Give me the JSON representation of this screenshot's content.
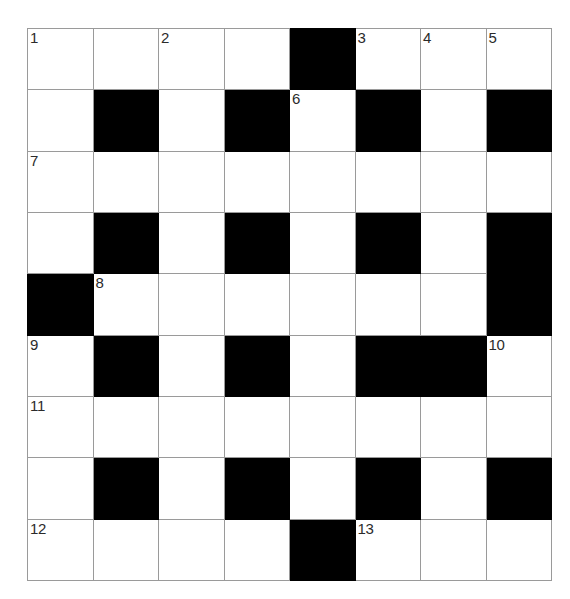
{
  "puzzle": {
    "title": "Crossword Grid",
    "rows": 9,
    "columns": 8,
    "cell_colors": {
      "open": "#ffffff",
      "blocked": "#000000",
      "grid_line": "#9a9a9a",
      "number_text": "#2b2b2b"
    },
    "grid": [
      [
        {
          "state": "open",
          "number": "1"
        },
        {
          "state": "open",
          "number": ""
        },
        {
          "state": "open",
          "number": "2"
        },
        {
          "state": "open",
          "number": ""
        },
        {
          "state": "blocked",
          "number": ""
        },
        {
          "state": "open",
          "number": "3"
        },
        {
          "state": "open",
          "number": "4"
        },
        {
          "state": "open",
          "number": "5"
        }
      ],
      [
        {
          "state": "open",
          "number": ""
        },
        {
          "state": "blocked",
          "number": ""
        },
        {
          "state": "open",
          "number": ""
        },
        {
          "state": "blocked",
          "number": ""
        },
        {
          "state": "open",
          "number": "6"
        },
        {
          "state": "blocked",
          "number": ""
        },
        {
          "state": "open",
          "number": ""
        },
        {
          "state": "blocked",
          "number": ""
        }
      ],
      [
        {
          "state": "open",
          "number": "7"
        },
        {
          "state": "open",
          "number": ""
        },
        {
          "state": "open",
          "number": ""
        },
        {
          "state": "open",
          "number": ""
        },
        {
          "state": "open",
          "number": ""
        },
        {
          "state": "open",
          "number": ""
        },
        {
          "state": "open",
          "number": ""
        },
        {
          "state": "open",
          "number": ""
        }
      ],
      [
        {
          "state": "open",
          "number": ""
        },
        {
          "state": "blocked",
          "number": ""
        },
        {
          "state": "open",
          "number": ""
        },
        {
          "state": "blocked",
          "number": ""
        },
        {
          "state": "open",
          "number": ""
        },
        {
          "state": "blocked",
          "number": ""
        },
        {
          "state": "open",
          "number": ""
        },
        {
          "state": "blocked",
          "number": ""
        }
      ],
      [
        {
          "state": "blocked",
          "number": ""
        },
        {
          "state": "open",
          "number": "8"
        },
        {
          "state": "open",
          "number": ""
        },
        {
          "state": "open",
          "number": ""
        },
        {
          "state": "open",
          "number": ""
        },
        {
          "state": "open",
          "number": ""
        },
        {
          "state": "open",
          "number": ""
        },
        {
          "state": "blocked",
          "number": ""
        }
      ],
      [
        {
          "state": "open",
          "number": "9"
        },
        {
          "state": "blocked",
          "number": ""
        },
        {
          "state": "open",
          "number": ""
        },
        {
          "state": "blocked",
          "number": ""
        },
        {
          "state": "open",
          "number": ""
        },
        {
          "state": "blocked",
          "number": ""
        },
        {
          "state": "blocked",
          "number": ""
        },
        {
          "state": "open",
          "number": "10"
        }
      ],
      [
        {
          "state": "open",
          "number": "11"
        },
        {
          "state": "open",
          "number": ""
        },
        {
          "state": "open",
          "number": ""
        },
        {
          "state": "open",
          "number": ""
        },
        {
          "state": "open",
          "number": ""
        },
        {
          "state": "open",
          "number": ""
        },
        {
          "state": "open",
          "number": ""
        },
        {
          "state": "open",
          "number": ""
        }
      ],
      [
        {
          "state": "open",
          "number": ""
        },
        {
          "state": "blocked",
          "number": ""
        },
        {
          "state": "open",
          "number": ""
        },
        {
          "state": "blocked",
          "number": ""
        },
        {
          "state": "open",
          "number": ""
        },
        {
          "state": "blocked",
          "number": ""
        },
        {
          "state": "open",
          "number": ""
        },
        {
          "state": "blocked",
          "number": ""
        }
      ],
      [
        {
          "state": "open",
          "number": "12"
        },
        {
          "state": "open",
          "number": ""
        },
        {
          "state": "open",
          "number": ""
        },
        {
          "state": "open",
          "number": ""
        },
        {
          "state": "blocked",
          "number": ""
        },
        {
          "state": "open",
          "number": "13"
        },
        {
          "state": "open",
          "number": ""
        },
        {
          "state": "open",
          "number": ""
        }
      ]
    ]
  }
}
